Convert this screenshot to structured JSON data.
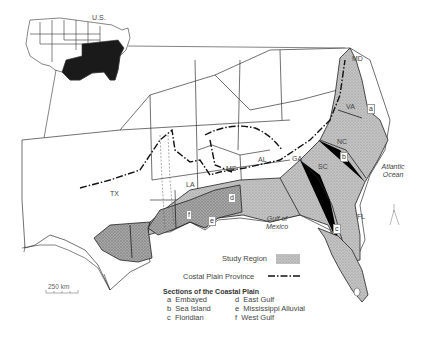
{
  "inset": {
    "label": "U.S."
  },
  "states": [
    {
      "id": "md",
      "label": "MD"
    },
    {
      "id": "va",
      "label": "VA"
    },
    {
      "id": "nc",
      "label": "NC"
    },
    {
      "id": "sc",
      "label": "SC"
    },
    {
      "id": "ga",
      "label": "GA"
    },
    {
      "id": "al",
      "label": "AL"
    },
    {
      "id": "ms",
      "label": "MS"
    },
    {
      "id": "la",
      "label": "LA"
    },
    {
      "id": "tx",
      "label": "TX"
    },
    {
      "id": "fl",
      "label": "FL"
    }
  ],
  "water": {
    "atlantic": "Atlantic Ocean",
    "gulf": "Gulf of Mexico"
  },
  "section_markers": [
    "a",
    "b",
    "c",
    "d",
    "e",
    "f"
  ],
  "legend": {
    "study_region": "Study Region",
    "province": "Costal Plain Province",
    "sections_title": "Sections of the Coastal Plain",
    "sections": [
      {
        "key": "a",
        "name": "Embayed"
      },
      {
        "key": "d",
        "name": "East Gulf"
      },
      {
        "key": "b",
        "name": "Sea Island"
      },
      {
        "key": "e",
        "name": "Mississippi Alluvial"
      },
      {
        "key": "c",
        "name": "Floridian"
      },
      {
        "key": "f",
        "name": "West Gulf"
      }
    ]
  },
  "scale": {
    "label": "250 km"
  },
  "colors": {
    "study_fill": "#bdbdbd",
    "inset_fill": "#1a1a1a",
    "line": "#222222"
  }
}
